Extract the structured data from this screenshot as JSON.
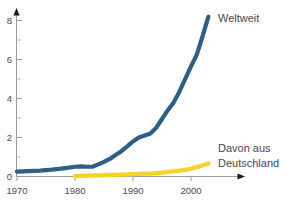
{
  "chart_data": {
    "type": "line",
    "title": "",
    "subtitle": "",
    "xlabel": "",
    "ylabel": "",
    "xlim": [
      1970,
      2004
    ],
    "ylim": [
      0,
      8.6
    ],
    "grid": false,
    "legend_position": "inline-right",
    "x_ticks": [
      "1970",
      "1980",
      "1990",
      "2000"
    ],
    "x_tick_values": [
      1970,
      1980,
      1990,
      2000
    ],
    "y_ticks": [
      "0",
      "2",
      "4",
      "6",
      "8"
    ],
    "y_tick_values": [
      0,
      2,
      4,
      6,
      8
    ],
    "y_minor_ticks": [
      1,
      3,
      5,
      7
    ],
    "series": [
      {
        "name": "Weltweit",
        "color": "#2c5f82",
        "label_x": 1972,
        "x": [
          1970,
          1972,
          1974,
          1976,
          1978,
          1980,
          1981,
          1982,
          1983,
          1984,
          1985,
          1986,
          1987,
          1988,
          1989,
          1990,
          1991,
          1992,
          1993,
          1994,
          1995,
          1996,
          1997,
          1998,
          1999,
          2000,
          2001,
          2002,
          2003
        ],
        "values": [
          0.25,
          0.28,
          0.3,
          0.35,
          0.42,
          0.5,
          0.52,
          0.5,
          0.5,
          0.62,
          0.75,
          0.9,
          1.1,
          1.3,
          1.55,
          1.8,
          2.0,
          2.1,
          2.2,
          2.5,
          2.95,
          3.4,
          3.8,
          4.35,
          5.0,
          5.65,
          6.25,
          7.2,
          8.2
        ]
      },
      {
        "name": "Davon aus Deutschland",
        "color": "#f5d327",
        "x": [
          1980,
          1982,
          1984,
          1986,
          1988,
          1990,
          1991,
          1992,
          1993,
          1994,
          1995,
          1996,
          1997,
          1998,
          1999,
          2000,
          2001,
          2002,
          2003
        ],
        "values": [
          0.02,
          0.04,
          0.06,
          0.08,
          0.1,
          0.12,
          0.13,
          0.15,
          0.14,
          0.17,
          0.2,
          0.24,
          0.26,
          0.3,
          0.34,
          0.4,
          0.48,
          0.57,
          0.67
        ]
      }
    ],
    "annotations": [
      {
        "name": "weltweit-label",
        "text": "Weltweit"
      },
      {
        "name": "deutschland-label-line1",
        "text": "Davon aus"
      },
      {
        "name": "deutschland-label-line2",
        "text": "Deutschland"
      }
    ]
  },
  "axis": {
    "x_axis_color": "#9a9a9a",
    "y_axis_color": "#9a9a9a",
    "arrow": "arrow-head"
  }
}
